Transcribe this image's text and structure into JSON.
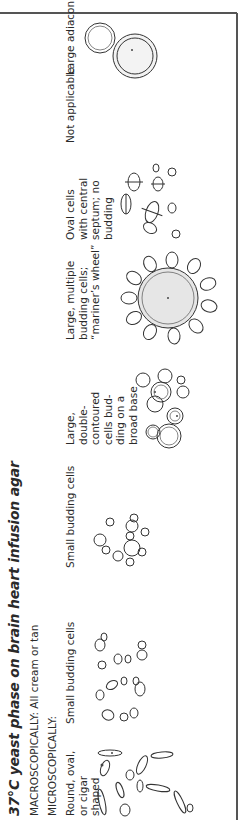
{
  "figure": {
    "title": "37°C yeast phase on brain heart infusion agar",
    "macroscopically": "MACROSCOPICALLY: All cream or tan",
    "microscopically": "MICROSCOPICALLY:",
    "columns": [
      {
        "label": "Round, oval, or cigar shaped",
        "drawing": "cigar-shaped-yeast-cells-illustration"
      },
      {
        "label": "Small budding cells",
        "drawing": "small-oval-budding-cells-illustration"
      },
      {
        "label": "Small budding cells",
        "drawing": "small-round-budding-cells-illustration"
      },
      {
        "label": "Large, double-contoured cells bud-ding on a broad base",
        "drawing": "broad-base-budding-cells-illustration"
      },
      {
        "label": "Large, multiple budding cells; “mariner’s wheel”",
        "drawing": "mariners-wheel-cell-illustration"
      },
      {
        "label": "Oval cells with central septum; no budding",
        "drawing": "septate-oval-cells-illustration"
      },
      {
        "label": "Not applicable",
        "drawing": null
      },
      {
        "label": "Large adiaconidia",
        "drawing": "adiaconidia-illustration"
      }
    ]
  }
}
